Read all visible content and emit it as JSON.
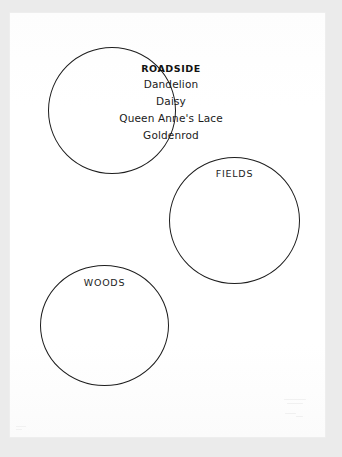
{
  "page": {
    "background_color": "#ebebeb",
    "paper_color": "#fefefe",
    "ink_color": "#1d1d1d",
    "type": "scanned-worksheet"
  },
  "circles": [
    {
      "id": "roadside",
      "name": "ROADSIDE",
      "heading": "ROADSIDE",
      "heading_style": "bold",
      "entries": [
        "Dandelion",
        "Daisy",
        "Queen Anne's Lace",
        "Goldenrod"
      ]
    },
    {
      "id": "fields",
      "name": "FIELDS",
      "heading": "FIELDS",
      "heading_style": "regular",
      "entries": []
    },
    {
      "id": "woods",
      "name": "WOODS",
      "heading": "WOODS",
      "heading_style": "regular",
      "entries": []
    }
  ]
}
